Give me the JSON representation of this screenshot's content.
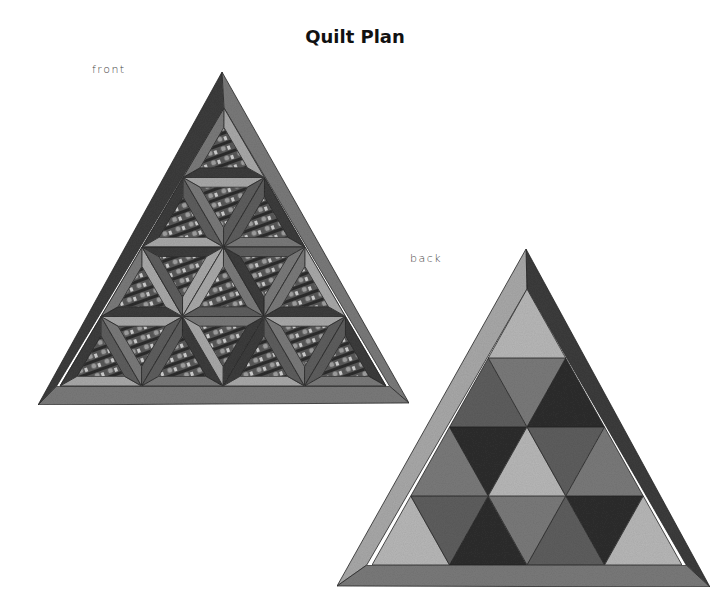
{
  "page": {
    "title": "Quilt Plan",
    "labels": {
      "front": "front",
      "back": "back"
    }
  },
  "colors": {
    "dark": "#3c3c3c",
    "darker": "#2e2e2e",
    "medium": "#7a7a7a",
    "mediumDark": "#5e5e5e",
    "light": "#a9a9a9",
    "lightMottled": "#b8b8b8",
    "border": "#555555",
    "print": "#6a6a6a"
  },
  "front": {
    "outer": [
      [
        222,
        72
      ],
      [
        38,
        405
      ],
      [
        409,
        403
      ]
    ],
    "borders": {
      "left": "dark",
      "right": "medium",
      "bottom": "medium"
    },
    "inner": [
      [
        224,
        108
      ],
      [
        60,
        386
      ],
      [
        386,
        386
      ]
    ],
    "rows": 4,
    "block_style": "interlocking-strips-with-print-centers"
  },
  "back": {
    "outer": [
      [
        526,
        249
      ],
      [
        337,
        586
      ],
      [
        710,
        587
      ]
    ],
    "borders": {
      "left": "light",
      "right": "dark",
      "bottom": "medium"
    },
    "inner": [
      [
        527,
        289
      ],
      [
        372,
        565
      ],
      [
        682,
        565
      ]
    ],
    "rows": [
      [
        "lightMottled"
      ],
      [
        "mediumDark",
        "medium",
        "darker"
      ],
      [
        "medium",
        "darker",
        "lightMottled",
        "mediumDark",
        "medium"
      ],
      [
        "lightMottled",
        "mediumDark",
        "darker",
        "medium",
        "mediumDark",
        "darker",
        "lightMottled"
      ]
    ]
  }
}
